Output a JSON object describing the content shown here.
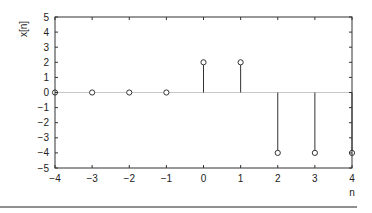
{
  "chart_data": {
    "type": "stem",
    "title": "",
    "xlabel": "n",
    "ylabel": "x[n]",
    "xlim": [
      -4,
      4
    ],
    "ylim": [
      -5,
      5
    ],
    "xticks": [
      -4,
      -3,
      -2,
      -1,
      0,
      1,
      2,
      3,
      4
    ],
    "yticks": [
      5,
      4,
      3,
      2,
      1,
      0,
      -1,
      -2,
      -3,
      -4,
      -5
    ],
    "x": [
      -4,
      -3,
      -2,
      -1,
      0,
      1,
      2,
      3,
      4
    ],
    "values": [
      0,
      0,
      0,
      0,
      2,
      2,
      -4,
      -4,
      -4
    ],
    "grid": false,
    "zero_line": true,
    "marker": "open-circle",
    "colors": {
      "stem": "#333333",
      "axis": "#333333",
      "zero_line": "#c8c8c8",
      "rule": "#222222"
    }
  }
}
